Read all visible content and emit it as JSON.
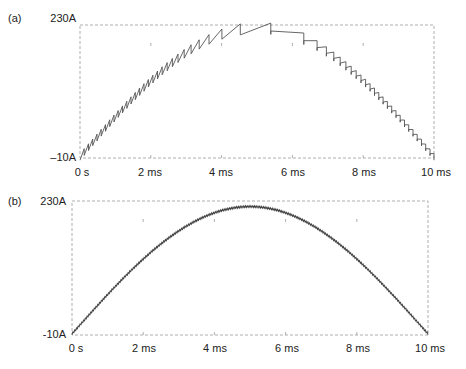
{
  "chart_data": [
    {
      "type": "line",
      "panel_label": "(a)",
      "title": "",
      "xlabel": "",
      "ylabel": "",
      "x_ticks": [
        "0 s",
        "2 ms",
        "4 ms",
        "6 ms",
        "8 ms",
        "10 ms"
      ],
      "y_ticks": [
        "230A",
        "-10A"
      ],
      "y_tick_labels_display": {
        "top": "230A",
        "bottom": "–10A"
      },
      "xlim_ms": [
        0,
        10
      ],
      "ylim": [
        -10,
        230
      ],
      "grid": "dotted frame with sparse tick marks",
      "series": [
        {
          "name": "current",
          "description": "Half-sine envelope (peak ~225A at ~5 ms) with sawtooth ripple; ripple frequency low near the peak and high near 0 and 10 ms",
          "peak_A": 225,
          "peak_time_ms": 5.2,
          "ripple_A_edges": 20,
          "points_ms_A": [
            [
              0,
              -8
            ],
            [
              1,
              70
            ],
            [
              2,
              125
            ],
            [
              3,
              175
            ],
            [
              4,
              210
            ],
            [
              5,
              222
            ],
            [
              5.3,
              228
            ],
            [
              6,
              205
            ],
            [
              7,
              160
            ],
            [
              8,
              115
            ],
            [
              9,
              60
            ],
            [
              10,
              -5
            ]
          ]
        }
      ]
    },
    {
      "type": "line",
      "panel_label": "(b)",
      "title": "",
      "xlabel": "",
      "ylabel": "",
      "x_ticks": [
        "0 s",
        "2 ms",
        "4 ms",
        "6 ms",
        "8 ms",
        "10 ms"
      ],
      "y_ticks": [
        "230A",
        "-10A"
      ],
      "y_tick_labels_display": {
        "top": "230A",
        "bottom": "-10A"
      },
      "xlim_ms": [
        0,
        10
      ],
      "ylim": [
        -10,
        230
      ],
      "grid": "dotted frame with sparse tick marks",
      "series": [
        {
          "name": "current",
          "description": "Half-sine with small high-frequency ripple, peak ~220A at ~5 ms",
          "peak_A": 220,
          "peak_time_ms": 5.0,
          "ripple_A": 3,
          "points_ms_A": [
            [
              0,
              -8
            ],
            [
              1,
              60
            ],
            [
              2,
              120
            ],
            [
              3,
              170
            ],
            [
              4,
              205
            ],
            [
              5,
              220
            ],
            [
              6,
              205
            ],
            [
              7,
              170
            ],
            [
              8,
              120
            ],
            [
              9,
              60
            ],
            [
              10,
              -8
            ]
          ]
        }
      ]
    }
  ],
  "panels": {
    "a": {
      "label": "(a)",
      "ymax": "230A",
      "ymin": "–10A",
      "xt": [
        "0 s",
        "2 ms",
        "4 ms",
        "6 ms",
        "8 ms",
        "10 ms"
      ]
    },
    "b": {
      "label": "(b)",
      "ymax": "230A",
      "ymin": "-10A",
      "xt": [
        "0 s",
        "2 ms",
        "4 ms",
        "6 ms",
        "8 ms",
        "10 ms"
      ]
    }
  },
  "colors": {
    "frame": "#9a9a9a",
    "trace_a": "#555555",
    "trace_b": "#444444",
    "text": "#222222"
  }
}
